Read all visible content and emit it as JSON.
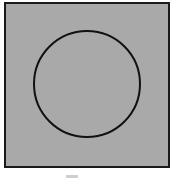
{
  "diagram": {
    "frame": {
      "fill": "#a9a9a9",
      "stroke": "#1a1a1a"
    },
    "circle": {
      "cx": 87,
      "cy": 84,
      "r": 53,
      "stroke": "#111111",
      "stroke_width": 2
    },
    "caption": ""
  }
}
